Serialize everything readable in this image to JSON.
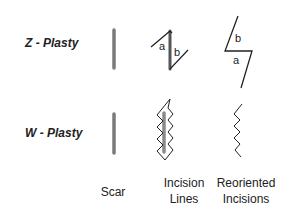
{
  "rows": [
    {
      "label": "Z - Plasty"
    },
    {
      "label": "W - Plasty"
    }
  ],
  "columns": [
    {
      "label_lines": [
        "Scar"
      ]
    },
    {
      "label_lines": [
        "Incision",
        "Lines"
      ]
    },
    {
      "label_lines": [
        "Reoriented",
        "Incisions"
      ]
    }
  ],
  "flap_labels": {
    "incision_a": "a",
    "incision_b": "b",
    "reoriented_b": "b",
    "reoriented_a": "a"
  },
  "colors": {
    "scar": "#7a7a7a",
    "line": "#222222"
  }
}
